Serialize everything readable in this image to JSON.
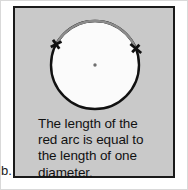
{
  "figure": {
    "label": "b.",
    "caption": "The length of the\nred arc is equal to\nthe length of one\ndiameter.",
    "caption_lines": [
      "The length of the",
      "red arc is equal to",
      "the length of one",
      "diameter."
    ],
    "panel_background_color": "#c9c9c9",
    "panel_border_color": "#1a1a1a",
    "outer_frame_color": "#d9d9d9",
    "page_background_color": "#ffffff",
    "text_color": "#111111"
  },
  "diagram": {
    "name": "circle-with-marked-arc",
    "circle": {
      "center_x": 80,
      "center_y": 57,
      "radius": 44,
      "fill_color": "#fbfbfb",
      "stroke_color": "#111111",
      "stroke_width": 2.4
    },
    "center_point": {
      "label": "center",
      "radius": 1.6,
      "color": "#6e6e6e"
    },
    "marked_arc": {
      "label": "red arc",
      "color": "#8c8c8c",
      "stroke_width": 2.2,
      "start_angle_deg": 208,
      "end_angle_deg": 338,
      "arc_length_equals": "one diameter"
    },
    "tick_marks": [
      {
        "label": "arc-start-tick",
        "angle_deg": 208,
        "color": "#111111",
        "length": 12,
        "width": 2.6
      },
      {
        "label": "arc-end-tick",
        "angle_deg": 338,
        "color": "#111111",
        "length": 12,
        "width": 2.6
      }
    ]
  }
}
